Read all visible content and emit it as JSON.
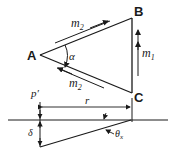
{
  "diagram": {
    "vertices": {
      "A": "A",
      "B": "B",
      "C": "C"
    },
    "forces": {
      "m2_upper": "m",
      "m2_upper_sub": "2",
      "m2_lower": "m",
      "m2_lower_sub": "2",
      "m1": "m",
      "m1_sub": "1"
    },
    "angle_alpha": "α",
    "point_p": "p′",
    "dimension_r": "r",
    "deflection_delta": "δ",
    "angle_theta": "θ",
    "angle_theta_sub": "x",
    "colors": {
      "ink": "#1a1a1a",
      "background": "#ffffff"
    }
  }
}
